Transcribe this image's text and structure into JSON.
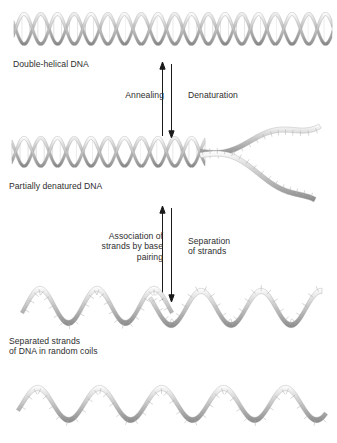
{
  "figure": {
    "background_color": "#ffffff",
    "text_color": "#2e2e2e",
    "strand_color": "#8d8d8d",
    "arrow_color": "#1a1a1a"
  },
  "labels": {
    "duplex": "Double-helical DNA",
    "partial": "Partially denatured DNA",
    "separated": "Separated strands\nof DNA in random coils"
  },
  "arrows": {
    "pair_one": {
      "up_label": "Annealing",
      "down_label": "Denaturation"
    },
    "pair_two": {
      "up_label": "Association of\nstrands by base\npairing",
      "down_label": "Separation\nof strands"
    }
  },
  "stages": [
    {
      "name": "double-helical-dna",
      "caption": "Double-helical DNA",
      "state": "fully base-paired duplex",
      "rungs": 40
    },
    {
      "name": "partially-denatured-dna",
      "caption": "Partially denatured DNA",
      "state": "duplex at left, unwound fork at right",
      "rungs": 24
    },
    {
      "name": "separated-strands",
      "caption": "Separated strands of DNA in random coils",
      "state": "two independent single strands in random coils",
      "rungs": 0
    }
  ]
}
